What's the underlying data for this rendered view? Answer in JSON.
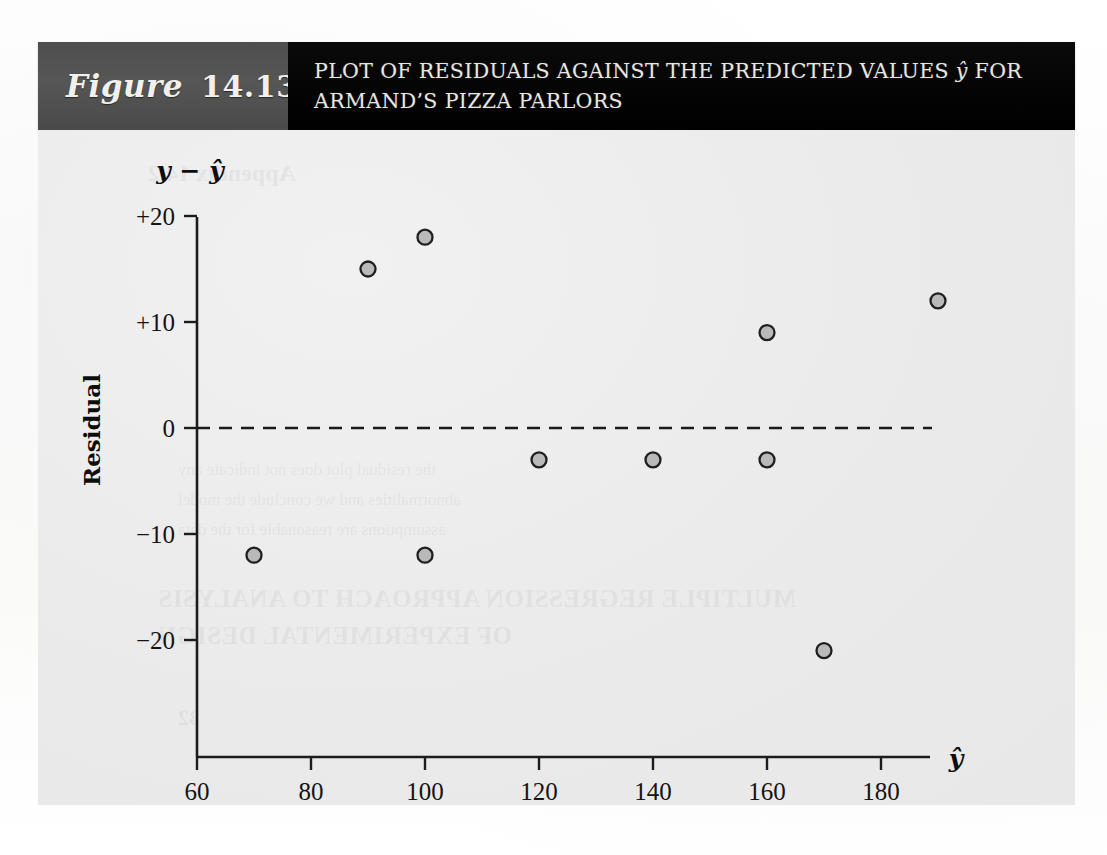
{
  "figure": {
    "label_word": "Figure",
    "number": "14.13",
    "title_line1_pre": "PLOT OF RESIDUALS AGAINST THE PREDICTED VALUES ",
    "title_line1_hat": "ŷ",
    "title_line1_post": " FOR",
    "title_line2": "ARMAND’S PIZZA PARLORS"
  },
  "colors": {
    "figure_box": "#4e4e4e",
    "title_box": "#000000",
    "panel": "#ebebeb",
    "ink": "#141414",
    "point_fill": "#b9b9b9",
    "point_stroke": "#1f1f1f"
  },
  "background_bleed": [
    "MULTIPLE REGRESSION APPROACH TO ANALYSIS",
    "OF EXPERIMENTAL DESIGN",
    "the residual plot does not indicate any",
    "abnormalities and we conclude the model",
    "assumptions are reasonable for the data",
    "Appendix 14.2",
    "32"
  ],
  "chart_data": {
    "type": "scatter",
    "title": "PLOT OF RESIDUALS AGAINST THE PREDICTED VALUES ŷ FOR ARMAND’S PIZZA PARLORS",
    "xlabel": "ŷ",
    "ylabel": "Residual",
    "y_axis_symbol": "y − ŷ",
    "x": [
      70,
      90,
      100,
      100,
      120,
      140,
      160,
      160,
      170,
      190
    ],
    "y": [
      -12,
      15,
      18,
      -12,
      -3,
      -3,
      9,
      -3,
      -21,
      12
    ],
    "points": [
      {
        "x": 70,
        "y": -12
      },
      {
        "x": 90,
        "y": 15
      },
      {
        "x": 100,
        "y": 18
      },
      {
        "x": 100,
        "y": -12
      },
      {
        "x": 120,
        "y": -3
      },
      {
        "x": 140,
        "y": -3
      },
      {
        "x": 160,
        "y": 9
      },
      {
        "x": 160,
        "y": -3
      },
      {
        "x": 170,
        "y": -21
      },
      {
        "x": 190,
        "y": 12
      }
    ],
    "xlim": [
      60,
      195
    ],
    "ylim": [
      -25,
      21
    ],
    "xticks": [
      60,
      80,
      100,
      120,
      140,
      160,
      180
    ],
    "xtick_labels": [
      "60",
      "80",
      "100",
      "120",
      "140",
      "160",
      "180"
    ],
    "yticks": [
      20,
      10,
      0,
      -10,
      -20
    ],
    "ytick_labels": [
      "+20",
      "+10",
      "0",
      "−10",
      "−20"
    ],
    "grid": false,
    "legend": null,
    "reference_line": {
      "y": 0,
      "style": "dashed"
    }
  }
}
